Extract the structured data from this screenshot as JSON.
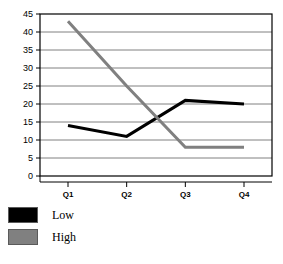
{
  "chart_data": {
    "type": "line",
    "title": "",
    "xlabel": "",
    "ylabel": "",
    "categories": [
      "Q1",
      "Q2",
      "Q3",
      "Q4"
    ],
    "series": [
      {
        "name": "Low",
        "values": [
          14,
          11,
          21,
          20
        ],
        "color": "#000000"
      },
      {
        "name": "High",
        "values": [
          43,
          25,
          8,
          8
        ],
        "color": "#808080"
      }
    ],
    "ylim": [
      0,
      45
    ],
    "ytick_step": 5,
    "yticks": [
      "0",
      "5",
      "10",
      "15",
      "20",
      "25",
      "30",
      "35",
      "40",
      "45"
    ],
    "grid": true,
    "grid_axis": "y",
    "grid_color": "#808080",
    "legend_position": "bottom-left",
    "plot_border_color": "#000000",
    "background_color": "#ffffff"
  },
  "legend": {
    "items": [
      {
        "label": "Low",
        "swatch_name": "legend-swatch-low"
      },
      {
        "label": "High",
        "swatch_name": "legend-swatch-high"
      }
    ]
  },
  "axes": {
    "y_tick_labels": [
      "45",
      "40",
      "35",
      "30",
      "25",
      "20",
      "15",
      "10",
      "5",
      "0"
    ],
    "x_tick_labels": [
      "Q1",
      "Q2",
      "Q3",
      "Q4"
    ]
  }
}
